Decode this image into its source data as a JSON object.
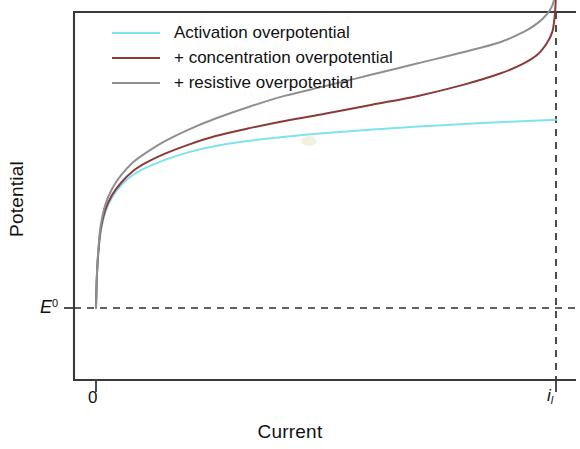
{
  "chart_data": {
    "type": "line",
    "title": "",
    "xlabel": "Current",
    "ylabel": "Potential",
    "xticks": [
      {
        "label": "0",
        "value": 0
      },
      {
        "label": "i",
        "sub": "l",
        "value": 1.0
      }
    ],
    "yticks": [
      {
        "label": "E",
        "sup": "0",
        "value": 0
      }
    ],
    "xlim": [
      -0.045,
      1.045
    ],
    "ylim": [
      -0.12,
      1.32
    ],
    "grid": false,
    "legend_position": "top-left",
    "annotations": [
      {
        "name": "limiting-current-line",
        "type": "vline",
        "x": 1.0,
        "style": "dashed"
      },
      {
        "name": "equilibrium-potential-line",
        "type": "hline",
        "y": 0,
        "style": "dashed"
      }
    ],
    "series": [
      {
        "name": "Activation overpotential",
        "color": "#7FE3EF",
        "x": [
          0.0,
          0.002,
          0.005,
          0.01,
          0.02,
          0.035,
          0.055,
          0.08,
          0.11,
          0.15,
          0.2,
          0.26,
          0.33,
          0.41,
          0.5,
          0.6,
          0.7,
          0.8,
          0.9,
          1.0
        ],
        "y": [
          0.0,
          0.13,
          0.22,
          0.3,
          0.38,
          0.44,
          0.49,
          0.53,
          0.56,
          0.59,
          0.62,
          0.645,
          0.665,
          0.682,
          0.697,
          0.711,
          0.723,
          0.733,
          0.742,
          0.75
        ]
      },
      {
        "name": "+ concentration overpotential",
        "color": "#8B3A3A",
        "x": [
          0.0,
          0.002,
          0.005,
          0.01,
          0.02,
          0.035,
          0.055,
          0.08,
          0.11,
          0.15,
          0.2,
          0.26,
          0.33,
          0.41,
          0.5,
          0.6,
          0.7,
          0.8,
          0.88,
          0.93,
          0.96,
          0.98,
          0.992,
          0.997,
          0.999,
          1.0
        ],
        "y": [
          0.0,
          0.13,
          0.22,
          0.31,
          0.39,
          0.45,
          0.5,
          0.545,
          0.58,
          0.615,
          0.65,
          0.685,
          0.715,
          0.745,
          0.775,
          0.81,
          0.845,
          0.89,
          0.935,
          0.975,
          1.01,
          1.055,
          1.1,
          1.16,
          1.21,
          1.26
        ]
      },
      {
        "name": "+ resistive overpotential",
        "color": "#8F8F8F",
        "x": [
          0.0,
          0.002,
          0.005,
          0.01,
          0.02,
          0.035,
          0.055,
          0.08,
          0.11,
          0.15,
          0.2,
          0.26,
          0.33,
          0.41,
          0.5,
          0.6,
          0.7,
          0.8,
          0.88,
          0.93,
          0.96,
          0.98,
          0.992,
          0.997,
          0.999,
          1.0
        ],
        "y": [
          0.0,
          0.135,
          0.23,
          0.325,
          0.41,
          0.475,
          0.53,
          0.58,
          0.62,
          0.665,
          0.71,
          0.755,
          0.8,
          0.845,
          0.885,
          0.93,
          0.975,
          1.02,
          1.06,
          1.1,
          1.135,
          1.17,
          1.205,
          1.24,
          1.27,
          1.3
        ]
      }
    ]
  },
  "legend": {
    "items": [
      {
        "label": "Activation overpotential",
        "color": "#7FE3EF"
      },
      {
        "label": "+ concentration overpotential",
        "color": "#8B3A3A"
      },
      {
        "label": "+ resistive overpotential",
        "color": "#8F8F8F"
      }
    ]
  },
  "axes": {
    "ylabel": "Potential",
    "xlabel": "Current",
    "x_tick_zero": "0",
    "x_tick_limit": "i",
    "x_tick_limit_sub": "l",
    "y_tick_e0": "E",
    "y_tick_e0_sup": "0"
  },
  "colors": {
    "activation": "#7FE3EF",
    "concentration": "#8B3A3A",
    "resistive": "#8F8F8F",
    "axis": "#3a3a3a",
    "background": "#ffffff"
  }
}
